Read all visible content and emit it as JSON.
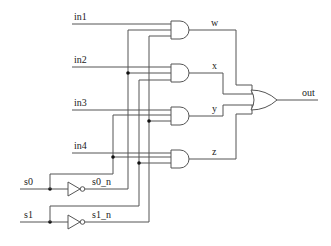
{
  "diagram": {
    "inputs": [
      {
        "label": "in1"
      },
      {
        "label": "in2"
      },
      {
        "label": "in3"
      },
      {
        "label": "in4"
      }
    ],
    "selects": [
      {
        "label": "s0",
        "inverted_label": "s0_n"
      },
      {
        "label": "s1",
        "inverted_label": "s1_n"
      }
    ],
    "and_outputs": [
      {
        "label": "w"
      },
      {
        "label": "x"
      },
      {
        "label": "y"
      },
      {
        "label": "z"
      }
    ],
    "output": {
      "label": "out"
    },
    "gates": {
      "and_count": 4,
      "or_count": 1,
      "not_count": 2
    },
    "colors": {
      "wire": "#555555",
      "junction": "#111111",
      "background": "#ffffff"
    }
  }
}
